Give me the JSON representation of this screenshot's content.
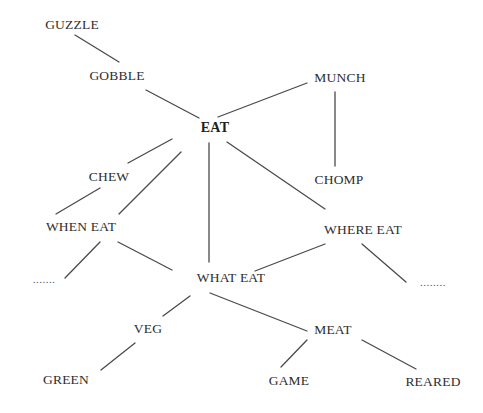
{
  "diagram": {
    "type": "semantic-network",
    "root": "EAT",
    "nodes": [
      {
        "id": "guzzle",
        "label": "GUZZLE",
        "x": 72,
        "y": 25,
        "bold": false
      },
      {
        "id": "gobble",
        "label": "GOBBLE",
        "x": 117,
        "y": 76,
        "bold": false
      },
      {
        "id": "eat",
        "label": "EAT",
        "x": 215,
        "y": 128,
        "bold": true
      },
      {
        "id": "munch",
        "label": "MUNCH",
        "x": 340,
        "y": 78,
        "bold": false
      },
      {
        "id": "chomp",
        "label": "CHOMP",
        "x": 339,
        "y": 180,
        "bold": false
      },
      {
        "id": "chew",
        "label": "CHEW",
        "x": 109,
        "y": 177,
        "bold": false
      },
      {
        "id": "when_eat",
        "label": "WHEN EAT",
        "x": 81,
        "y": 227,
        "bold": false
      },
      {
        "id": "where_eat",
        "label": "WHERE EAT",
        "x": 363,
        "y": 230,
        "bold": false
      },
      {
        "id": "what_eat",
        "label": "WHAT EAT",
        "x": 231,
        "y": 278,
        "bold": false
      },
      {
        "id": "dots_left",
        "label": ".......",
        "x": 44,
        "y": 279,
        "bold": false
      },
      {
        "id": "dots_right",
        "label": "........",
        "x": 433,
        "y": 282,
        "bold": false
      },
      {
        "id": "veg",
        "label": "VEG",
        "x": 148,
        "y": 329,
        "bold": false
      },
      {
        "id": "meat",
        "label": "MEAT",
        "x": 333,
        "y": 330,
        "bold": false
      },
      {
        "id": "green",
        "label": "GREEN",
        "x": 66,
        "y": 380,
        "bold": false
      },
      {
        "id": "game",
        "label": "GAME",
        "x": 289,
        "y": 381,
        "bold": false
      },
      {
        "id": "reared",
        "label": "REARED",
        "x": 433,
        "y": 382,
        "bold": false
      }
    ],
    "edges": [
      {
        "from": "guzzle",
        "to": "gobble",
        "x1": 75,
        "y1": 35,
        "x2": 119,
        "y2": 62
      },
      {
        "from": "gobble",
        "to": "eat",
        "x1": 146,
        "y1": 90,
        "x2": 199,
        "y2": 118
      },
      {
        "from": "eat",
        "to": "munch",
        "x1": 218,
        "y1": 117,
        "x2": 307,
        "y2": 83
      },
      {
        "from": "munch",
        "to": "chomp",
        "x1": 335,
        "y1": 92,
        "x2": 335,
        "y2": 166
      },
      {
        "from": "eat",
        "to": "chew",
        "x1": 172,
        "y1": 139,
        "x2": 128,
        "y2": 163
      },
      {
        "from": "eat",
        "to": "when_eat",
        "x1": 181,
        "y1": 152,
        "x2": 119,
        "y2": 214
      },
      {
        "from": "chew",
        "to": "when_eat",
        "x1": 100,
        "y1": 188,
        "x2": 56,
        "y2": 214
      },
      {
        "from": "eat",
        "to": "what_eat",
        "x1": 209,
        "y1": 143,
        "x2": 209,
        "y2": 262
      },
      {
        "from": "eat",
        "to": "where_eat",
        "x1": 227,
        "y1": 142,
        "x2": 325,
        "y2": 209
      },
      {
        "from": "when_eat",
        "to": "dots_left",
        "x1": 100,
        "y1": 242,
        "x2": 65,
        "y2": 278
      },
      {
        "from": "when_eat",
        "to": "what_eat",
        "x1": 118,
        "y1": 242,
        "x2": 172,
        "y2": 270
      },
      {
        "from": "where_eat",
        "to": "what_eat",
        "x1": 325,
        "y1": 244,
        "x2": 255,
        "y2": 271
      },
      {
        "from": "where_eat",
        "to": "dots_right",
        "x1": 362,
        "y1": 244,
        "x2": 406,
        "y2": 282
      },
      {
        "from": "what_eat",
        "to": "veg",
        "x1": 190,
        "y1": 296,
        "x2": 163,
        "y2": 316
      },
      {
        "from": "what_eat",
        "to": "meat",
        "x1": 210,
        "y1": 293,
        "x2": 307,
        "y2": 331
      },
      {
        "from": "veg",
        "to": "green",
        "x1": 135,
        "y1": 343,
        "x2": 101,
        "y2": 370
      },
      {
        "from": "meat",
        "to": "game",
        "x1": 307,
        "y1": 340,
        "x2": 281,
        "y2": 367
      },
      {
        "from": "meat",
        "to": "reared",
        "x1": 362,
        "y1": 340,
        "x2": 416,
        "y2": 369
      }
    ],
    "colors": {
      "background": "#ffffff",
      "text": "#2e2e2e",
      "edge": "#4a4a4a"
    }
  }
}
